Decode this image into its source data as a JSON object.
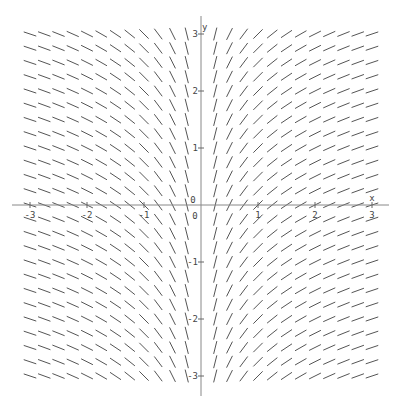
{
  "chart_data": {
    "type": "slope-field",
    "title": "",
    "equation": "dy/dx = 1/x",
    "xlabel": "x",
    "ylabel": "y",
    "xlim": [
      -3.3,
      3.3
    ],
    "ylim": [
      -3.4,
      3.4
    ],
    "grid_step": 0.25,
    "x_range": [
      -3,
      3
    ],
    "y_range": [
      -3,
      3
    ],
    "x_ticks": [
      -3,
      -2,
      -1,
      0,
      1,
      2,
      3
    ],
    "y_ticks": [
      -3,
      -2,
      -1,
      1,
      2,
      3
    ],
    "x_tick_labels": [
      "-3",
      "-2",
      "-1",
      "0",
      "1",
      "2",
      "3"
    ],
    "y_tick_labels": [
      "-3",
      "-2",
      "-1",
      "1",
      "2",
      "3"
    ],
    "origin_label": "0",
    "omit_x": 0,
    "colors": {
      "segment": "#555555",
      "axis": "#888888"
    }
  }
}
